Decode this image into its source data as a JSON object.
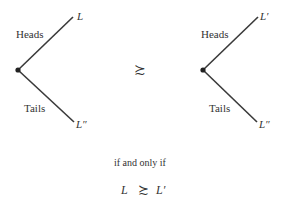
{
  "left_tree": {
    "heads_label": "Heads",
    "tails_label": "Tails",
    "heads_outcome": "L",
    "tails_outcome": "L″"
  },
  "relation_symbol": "≿",
  "right_tree": {
    "heads_label": "Heads",
    "tails_label": "Tails",
    "heads_outcome": "L′",
    "tails_outcome": "L″"
  },
  "conclusion": {
    "connector": "if and only if",
    "lhs": "L",
    "symbol": "≿",
    "rhs": "L′"
  },
  "colors": {
    "line": "#3a3a3a",
    "text": "#333333"
  }
}
